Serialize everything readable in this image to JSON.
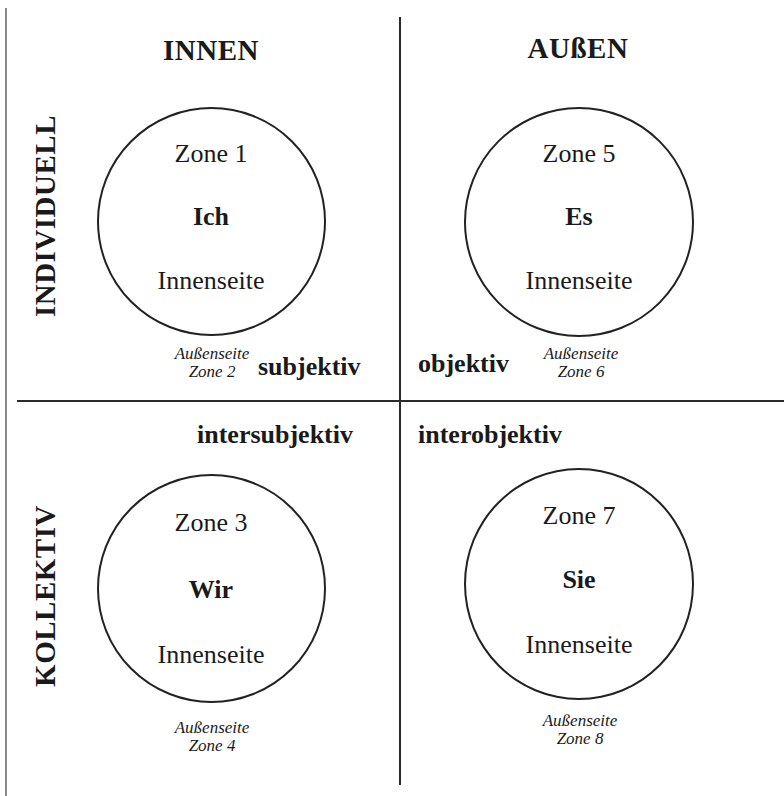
{
  "diagram": {
    "columns": {
      "left": "INNEN",
      "right": "AUßEN"
    },
    "rows": {
      "top": "INDIVIDUELL",
      "bottom": "KOLLEKTIV"
    },
    "quadrants": [
      {
        "id": "upper-left",
        "zone_inner": "Zone 1",
        "pronoun": "Ich",
        "inner_label": "Innenseite",
        "outer_label": "Außenseite",
        "zone_outer": "Zone 2",
        "perspective": "subjektiv"
      },
      {
        "id": "upper-right",
        "zone_inner": "Zone 5",
        "pronoun": "Es",
        "inner_label": "Innenseite",
        "outer_label": "Außenseite",
        "zone_outer": "Zone 6",
        "perspective": "objektiv"
      },
      {
        "id": "lower-left",
        "zone_inner": "Zone 3",
        "pronoun": "Wir",
        "inner_label": "Innenseite",
        "outer_label": "Außenseite",
        "zone_outer": "Zone 4",
        "perspective": "intersubjektiv"
      },
      {
        "id": "lower-right",
        "zone_inner": "Zone 7",
        "pronoun": "Sie",
        "inner_label": "Innenseite",
        "outer_label": "Außenseite",
        "zone_outer": "Zone 8",
        "perspective": "interobjektiv"
      }
    ],
    "colors": {
      "line": "#2a2a2a",
      "border": "#8a8a8a",
      "text": "#1a1a1a",
      "background": "#ffffff"
    }
  }
}
